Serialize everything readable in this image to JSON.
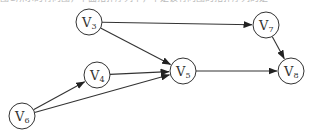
{
  "caption_fragment": "图G所示的有向图，下面拓扑序列中，不是该有向图的拓扑序列的是",
  "graph": {
    "type": "directed",
    "nodes": [
      {
        "id": "V3",
        "base": "V",
        "sub": "3",
        "x": 89,
        "y": 22
      },
      {
        "id": "V7",
        "base": "V",
        "sub": "7",
        "x": 266,
        "y": 25
      },
      {
        "id": "V4",
        "base": "V",
        "sub": "4",
        "x": 97,
        "y": 75
      },
      {
        "id": "V5",
        "base": "V",
        "sub": "5",
        "x": 183,
        "y": 71
      },
      {
        "id": "V8",
        "base": "V",
        "sub": "8",
        "x": 291,
        "y": 71
      },
      {
        "id": "V6",
        "base": "V",
        "sub": "6",
        "x": 22,
        "y": 116
      }
    ],
    "edges": [
      {
        "from": "V3",
        "to": "V7"
      },
      {
        "from": "V3",
        "to": "V5"
      },
      {
        "from": "V4",
        "to": "V5"
      },
      {
        "from": "V6",
        "to": "V4"
      },
      {
        "from": "V6",
        "to": "V5"
      },
      {
        "from": "V5",
        "to": "V8"
      },
      {
        "from": "V7",
        "to": "V8"
      }
    ]
  }
}
